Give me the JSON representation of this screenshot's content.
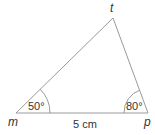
{
  "diagram": {
    "type": "triangle",
    "vertices": {
      "m": {
        "label": "m"
      },
      "p": {
        "label": "p"
      },
      "t": {
        "label": "t"
      }
    },
    "angles": {
      "m": "50°",
      "p": "80°"
    },
    "side_mp": "5 cm",
    "colors": {
      "line": "#9a9a9a",
      "text": "#333333"
    }
  }
}
